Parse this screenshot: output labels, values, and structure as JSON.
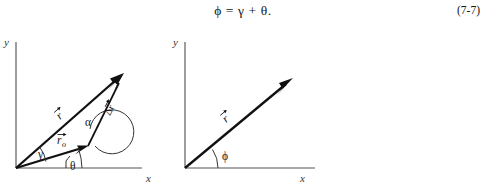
{
  "document": {
    "equation": {
      "text": "ϕ = γ + θ.",
      "number": "(7-7)"
    }
  },
  "figures": {
    "left": {
      "name": "position-vector-triangle-diagram",
      "axes": {
        "x_label": "x",
        "y_label": "y",
        "origin": [
          16,
          140
        ],
        "x_end": [
          142,
          140
        ],
        "y_end": [
          16,
          14
        ]
      },
      "vectors": [
        {
          "id": "r-vector",
          "label": "r",
          "accent": "arrow",
          "from": [
            16,
            140
          ],
          "to": [
            124,
            45
          ],
          "label_pos": [
            60,
            92
          ],
          "label_rotation": -41
        },
        {
          "id": "r-naught-vector",
          "label": "r",
          "subscript": "o",
          "accent": "arrow",
          "from": [
            16,
            140
          ],
          "to": [
            88,
            118
          ],
          "label_pos": [
            58,
            115
          ],
          "label_rotation": 0
        },
        {
          "id": "delta-r-vector",
          "label": "Δr",
          "accent": "arrow",
          "from": [
            88,
            118
          ],
          "to": [
            124,
            45
          ],
          "label_pos": [
            113,
            84
          ],
          "label_rotation": -63
        }
      ],
      "angles": [
        {
          "id": "gamma-angle",
          "label": "γ",
          "label_pos": [
            42,
            126
          ]
        },
        {
          "id": "alpha-angle",
          "label": "α",
          "label_pos": [
            88,
            95
          ]
        },
        {
          "id": "theta-angle",
          "label": "θ",
          "label_pos": [
            73,
            138
          ]
        }
      ]
    },
    "right": {
      "name": "resultant-vector-diagram",
      "axes": {
        "x_label": "x",
        "y_label": "y",
        "origin": [
          185,
          140
        ],
        "x_end": [
          315,
          140
        ],
        "y_end": [
          185,
          14
        ]
      },
      "vectors": [
        {
          "id": "r-vector",
          "label": "r",
          "accent": "arrow",
          "from": [
            185,
            140
          ],
          "to": [
            293,
            50
          ],
          "label_pos": [
            228,
            93
          ],
          "label_rotation": -40
        }
      ],
      "angles": [
        {
          "id": "phi-angle",
          "label": "ϕ",
          "label_pos": [
            216,
            126
          ]
        }
      ]
    }
  },
  "colors": {
    "page_background": "#ffffff",
    "ink": "#111111",
    "axis": "#555555",
    "arc": "#333333"
  }
}
